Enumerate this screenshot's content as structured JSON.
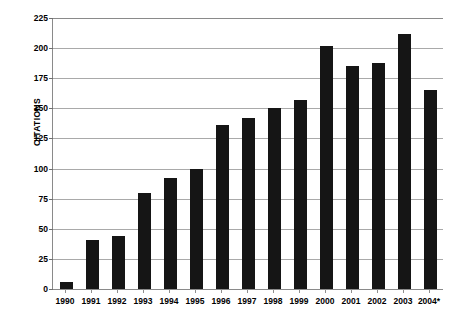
{
  "chart_data": {
    "type": "bar",
    "title": "",
    "xlabel": "",
    "ylabel": "CITATIONS",
    "ylim": [
      0,
      225
    ],
    "ytick_step": 25,
    "yticks": [
      225,
      200,
      175,
      150,
      125,
      100,
      75,
      50,
      25,
      0
    ],
    "grid": true,
    "legend": null,
    "bar_color": "#151515",
    "grid_color": "#a9a9a9",
    "axis_color": "#8a8a8a",
    "categories": [
      "1990",
      "1991",
      "1992",
      "1993",
      "1994",
      "1995",
      "1996",
      "1997",
      "1998",
      "1999",
      "2000",
      "2001",
      "2002",
      "2003",
      "2004*"
    ],
    "values": [
      6,
      41,
      44,
      80,
      92,
      100,
      136,
      142,
      150,
      157,
      202,
      185,
      188,
      212,
      165
    ],
    "annotations": [
      "2004 value marked with an asterisk (partial year)"
    ]
  }
}
